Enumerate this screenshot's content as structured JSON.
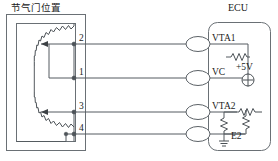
{
  "diagram": {
    "type": "automotive-circuit-schematic",
    "sensor_block": {
      "title": "节气门位置",
      "title_meaning": "Throttle Position",
      "component": "dual-track-potentiometer",
      "wipers": 2
    },
    "ecu_block": {
      "title": "ECU",
      "terminals": [
        {
          "name": "VTA1"
        },
        {
          "name": "VC"
        },
        {
          "name": "VTA2"
        },
        {
          "name": "E2"
        }
      ],
      "supply_label": "+5V",
      "internal_components": [
        "pull-up-resistor-vta1",
        "voltage-source-5v",
        "series-resistor-vta2",
        "divider-resistor-left",
        "divider-resistor-right",
        "ground-e2"
      ]
    },
    "terminal_numbers": [
      "2",
      "1",
      "3",
      "4"
    ],
    "connector_count": 4,
    "colors": {
      "wire": "#555b60",
      "box": "#6a7075",
      "text": "#1a1a1a",
      "background": "#ffffff"
    }
  }
}
